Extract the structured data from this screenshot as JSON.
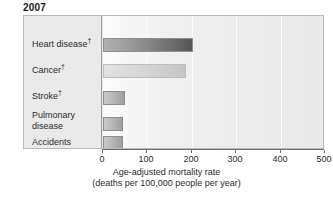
{
  "chart_data": {
    "type": "bar",
    "orientation": "horizontal",
    "title": "2007",
    "categories": [
      "Heart disease†",
      "Cancer†",
      "Stroke†",
      "Pulmonary disease",
      "Accidents"
    ],
    "values": [
      202,
      186,
      49,
      46,
      46
    ],
    "series": [
      {
        "name": "Age-adjusted mortality rate",
        "values": [
          202,
          186,
          49,
          46,
          46
        ]
      }
    ],
    "xlabel": "Age-adjusted mortality rate",
    "xlabel_sub": "(deaths per 100,000 people per year)",
    "ylabel": "",
    "xlim": [
      0,
      500
    ],
    "xticks": [
      0,
      100,
      200,
      300,
      400,
      500
    ],
    "xtick_labels": [
      "0",
      "100",
      "200",
      "300",
      "400",
      "500"
    ],
    "grid": true,
    "grid_axis": "x",
    "legend": false,
    "bar_colors": [
      "#6e6e6e",
      "#d0d0d0",
      "#b4b4b4",
      "#b4b4b4",
      "#b4b4b4"
    ],
    "plot_background": "#ededed",
    "frame_color": "#b9b9b9",
    "footnote_symbol": "†"
  },
  "title": {
    "text": "2007"
  },
  "categories": [
    {
      "label": "Heart disease",
      "dagger": "†",
      "value": 202
    },
    {
      "label": "Cancer",
      "dagger": "†",
      "value": 186
    },
    {
      "label": "Stroke",
      "dagger": "†",
      "value": 49
    },
    {
      "label": "Pulmonary",
      "label2": "disease",
      "dagger": "",
      "value": 46
    },
    {
      "label": "Accidents",
      "dagger": "",
      "value": 46
    }
  ],
  "axis": {
    "ticks": [
      "0",
      "100",
      "200",
      "300",
      "400",
      "500"
    ],
    "caption_line1": "Age-adjusted mortality rate",
    "caption_line2": "(deaths per 100,000 people per year)"
  }
}
